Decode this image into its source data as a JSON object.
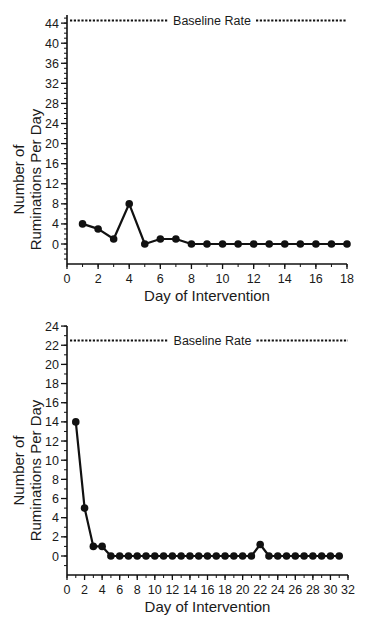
{
  "chart_data": [
    {
      "type": "line",
      "title": "",
      "xlabel": "Day of Intervention",
      "ylabel": "Number of Ruminations Per Day",
      "ylabel_lines": [
        "Number of",
        "Ruminations Per Day"
      ],
      "x_ticks": [
        0,
        2,
        4,
        6,
        8,
        10,
        12,
        14,
        16,
        18
      ],
      "y_ticks": [
        0,
        4,
        8,
        12,
        16,
        20,
        24,
        28,
        32,
        36,
        40,
        44
      ],
      "xlim": [
        0,
        18
      ],
      "ylim": [
        -4,
        46
      ],
      "grid": false,
      "reference_line": {
        "label": "Baseline Rate",
        "value": 44.5,
        "style": "dotted"
      },
      "series": [
        {
          "name": "Ruminations",
          "x": [
            1,
            2,
            3,
            4,
            5,
            6,
            7,
            8,
            9,
            10,
            11,
            12,
            13,
            14,
            15,
            16,
            17,
            18
          ],
          "values": [
            4,
            3,
            1,
            8,
            0,
            1,
            1,
            0,
            0,
            0,
            0,
            0,
            0,
            0,
            0,
            0,
            0,
            0
          ]
        }
      ]
    },
    {
      "type": "line",
      "title": "",
      "xlabel": "Day of Intervention",
      "ylabel": "Number of Ruminations Per Day",
      "ylabel_lines": [
        "Number of",
        "Ruminations Per Day"
      ],
      "x_ticks": [
        0,
        2,
        4,
        6,
        8,
        10,
        12,
        14,
        16,
        18,
        20,
        22,
        24,
        26,
        28,
        30,
        32
      ],
      "y_ticks": [
        0,
        2,
        4,
        6,
        8,
        10,
        12,
        14,
        16,
        18,
        20,
        22,
        24
      ],
      "xlim": [
        0,
        32
      ],
      "ylim": [
        -2,
        24
      ],
      "grid": false,
      "reference_line": {
        "label": "Baseline Rate",
        "value": 22.5,
        "style": "dotted"
      },
      "series": [
        {
          "name": "Ruminations",
          "x": [
            1,
            2,
            3,
            4,
            5,
            6,
            7,
            8,
            9,
            10,
            11,
            12,
            13,
            14,
            15,
            16,
            17,
            18,
            19,
            20,
            21,
            22,
            23,
            24,
            25,
            26,
            27,
            28,
            29,
            30,
            31
          ],
          "values": [
            14,
            5,
            1,
            1,
            0,
            0,
            0,
            0,
            0,
            0,
            0,
            0,
            0,
            0,
            0,
            0,
            0,
            0,
            0,
            0,
            0,
            1.2,
            0,
            0,
            0,
            0,
            0,
            0,
            0,
            0,
            0
          ]
        }
      ]
    }
  ],
  "layout": [
    {
      "x0px": 67,
      "x1px": 347,
      "y_zero_px": 244,
      "px_per_unit_y": 5.02,
      "axis_bottom_px": 264,
      "axis_top_px": 15,
      "minor_y_step": 1,
      "minor_x_step": 1
    },
    {
      "x0px": 67,
      "x1px": 348,
      "y_zero_px": 556,
      "px_per_unit_y": 9.58,
      "axis_bottom_px": 575,
      "axis_top_px": 326,
      "minor_y_step": 1,
      "minor_x_step": 1
    }
  ]
}
